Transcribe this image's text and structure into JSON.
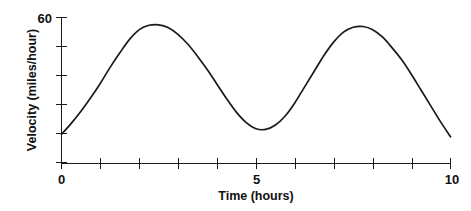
{
  "chart_data": {
    "type": "line",
    "title": "",
    "xlabel": "Time (hours)",
    "ylabel": "Velocity (miles/hour)",
    "xlim": [
      0,
      10
    ],
    "ylim": [
      0,
      60
    ],
    "grid": false,
    "legend": null,
    "x_ticks": [
      0,
      1,
      2,
      3,
      4,
      5,
      6,
      7,
      8,
      9,
      10
    ],
    "x_tick_labels": [
      "0",
      "",
      "",
      "",
      "",
      "5",
      "",
      "",
      "",
      "",
      "10"
    ],
    "y_ticks": [
      0,
      12,
      24,
      36,
      48,
      60
    ],
    "y_tick_labels": [
      "",
      "",
      "",
      "",
      "",
      "60"
    ],
    "series": [
      {
        "name": "velocity",
        "x": [
          0.0,
          0.25,
          0.5,
          0.75,
          1.0,
          1.25,
          1.5,
          1.75,
          2.0,
          2.25,
          2.5,
          2.75,
          3.0,
          3.25,
          3.5,
          3.75,
          4.0,
          4.25,
          4.5,
          4.75,
          5.0,
          5.25,
          5.5,
          5.75,
          6.0,
          6.25,
          6.5,
          6.75,
          7.0,
          7.25,
          7.5,
          7.75,
          8.0,
          8.25,
          8.5,
          8.75,
          9.0,
          9.25,
          9.5,
          9.75,
          10.0
        ],
        "values": [
          12.0,
          16.5,
          21.5,
          27.0,
          33.0,
          39.5,
          45.5,
          51.0,
          55.0,
          56.8,
          57.0,
          55.8,
          53.0,
          49.0,
          44.0,
          38.5,
          32.5,
          26.5,
          21.0,
          16.8,
          14.3,
          14.0,
          15.8,
          19.5,
          25.0,
          31.5,
          38.0,
          44.5,
          50.0,
          54.0,
          56.0,
          56.3,
          55.0,
          52.0,
          47.5,
          42.5,
          36.5,
          30.0,
          23.5,
          17.0,
          11.0
        ]
      }
    ],
    "annotations": {
      "peak_1": {
        "x": 2.4,
        "y": 57
      },
      "trough": {
        "x": 5.1,
        "y": 14
      },
      "peak_2": {
        "x": 7.7,
        "y": 56
      }
    },
    "colors": {
      "curve": "#1a1a1a",
      "axis": "#1a1a1a",
      "background": "#ffffff"
    }
  }
}
